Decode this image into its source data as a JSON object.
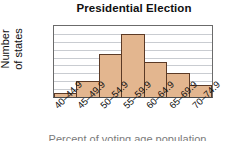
{
  "chart_data": {
    "type": "bar",
    "title": "Presidential Election",
    "xlabel": "Percent of voting age population",
    "ylabel": "Number of states",
    "ylabel_line1": "Number",
    "ylabel_line2": "of states",
    "categories": [
      "40–44.9",
      "45–49.9",
      "50–54.9",
      "55–59.9",
      "60–64.9",
      "65–69.9",
      "70–74.9"
    ],
    "values": [
      1,
      4,
      11,
      16,
      9,
      6,
      3
    ],
    "ylim": [
      0,
      18
    ],
    "ytick_labels": [
      "0",
      "6",
      "12",
      "18"
    ],
    "ytick_values": [
      0,
      6,
      12,
      18
    ],
    "gridline_values": [
      2,
      4,
      6,
      8,
      10,
      12,
      14,
      16
    ],
    "grid": true,
    "legend": "none",
    "bar_fill_color": "#e3b68f",
    "bar_border_color": "#5b3a26",
    "gridline_color": "#c9ccd1",
    "axis_color": "#6b6b6b",
    "text_color": "#101010"
  }
}
